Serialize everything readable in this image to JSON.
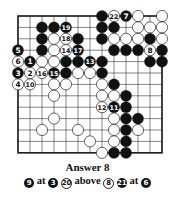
{
  "diagram": {
    "type": "go-board-partial",
    "grid": {
      "cols": 13,
      "rows": 13,
      "origin_x": 18,
      "origin_y": 16,
      "dx": 12,
      "dy": 11.4
    },
    "edges": [
      "top",
      "left",
      "right",
      "bottom"
    ],
    "colors": {
      "black": "#111111",
      "white": "#ffffff",
      "line": "#333333"
    },
    "stones": [
      {
        "c": 7,
        "r": 0,
        "color": "black"
      },
      {
        "c": 8,
        "r": 0,
        "color": "white",
        "label": "22"
      },
      {
        "c": 9,
        "r": 0,
        "color": "black",
        "label": "7"
      },
      {
        "c": 10,
        "r": 0,
        "color": "white"
      },
      {
        "c": 12,
        "r": 0,
        "color": "white"
      },
      {
        "c": 2,
        "r": 1,
        "color": "black"
      },
      {
        "c": 3,
        "r": 1,
        "color": "black"
      },
      {
        "c": 4,
        "r": 1,
        "color": "black",
        "label": "19"
      },
      {
        "c": 7,
        "r": 1,
        "color": "black"
      },
      {
        "c": 8,
        "r": 1,
        "color": "black"
      },
      {
        "c": 10,
        "r": 1,
        "color": "white"
      },
      {
        "c": 11,
        "r": 1,
        "color": "white"
      },
      {
        "c": 12,
        "r": 1,
        "color": "white"
      },
      {
        "c": 2,
        "r": 2,
        "color": "black"
      },
      {
        "c": 3,
        "r": 2,
        "color": "white"
      },
      {
        "c": 4,
        "r": 2,
        "color": "white",
        "label": "18"
      },
      {
        "c": 5,
        "r": 2,
        "color": "black"
      },
      {
        "c": 7,
        "r": 2,
        "color": "black"
      },
      {
        "c": 8,
        "r": 2,
        "color": "white"
      },
      {
        "c": 9,
        "r": 2,
        "color": "white"
      },
      {
        "c": 10,
        "r": 2,
        "color": "white"
      },
      {
        "c": 11,
        "r": 2,
        "color": "black"
      },
      {
        "c": 12,
        "r": 2,
        "color": "white"
      },
      {
        "c": 0,
        "r": 3,
        "color": "black",
        "label": "5"
      },
      {
        "c": 2,
        "r": 3,
        "color": "black"
      },
      {
        "c": 3,
        "r": 3,
        "color": "white"
      },
      {
        "c": 4,
        "r": 3,
        "color": "white",
        "label": "14"
      },
      {
        "c": 5,
        "r": 3,
        "color": "black",
        "label": "17"
      },
      {
        "c": 8,
        "r": 3,
        "color": "black"
      },
      {
        "c": 9,
        "r": 3,
        "color": "black"
      },
      {
        "c": 10,
        "r": 3,
        "color": "black"
      },
      {
        "c": 11,
        "r": 3,
        "color": "white",
        "label": "8"
      },
      {
        "c": 12,
        "r": 3,
        "color": "black"
      },
      {
        "c": 0,
        "r": 4,
        "color": "white",
        "label": "6"
      },
      {
        "c": 1,
        "r": 4,
        "color": "black",
        "label": "1"
      },
      {
        "c": 2,
        "r": 4,
        "color": "white"
      },
      {
        "c": 3,
        "r": 4,
        "color": "white"
      },
      {
        "c": 4,
        "r": 4,
        "color": "black"
      },
      {
        "c": 5,
        "r": 4,
        "color": "black"
      },
      {
        "c": 6,
        "r": 4,
        "color": "black",
        "label": "13"
      },
      {
        "c": 7,
        "r": 4,
        "color": "black"
      },
      {
        "c": 11,
        "r": 4,
        "color": "black"
      },
      {
        "c": 12,
        "r": 4,
        "color": "black"
      },
      {
        "c": 0,
        "r": 5,
        "color": "black",
        "label": "3"
      },
      {
        "c": 1,
        "r": 5,
        "color": "white",
        "label": "2"
      },
      {
        "c": 2,
        "r": 5,
        "color": "white",
        "label": "16"
      },
      {
        "c": 3,
        "r": 5,
        "color": "black",
        "label": "15"
      },
      {
        "c": 4,
        "r": 5,
        "color": "black"
      },
      {
        "c": 5,
        "r": 5,
        "color": "white"
      },
      {
        "c": 6,
        "r": 5,
        "color": "white"
      },
      {
        "c": 7,
        "r": 5,
        "color": "black"
      },
      {
        "c": 0,
        "r": 6,
        "color": "white",
        "label": "4"
      },
      {
        "c": 1,
        "r": 6,
        "color": "white",
        "label": "10"
      },
      {
        "c": 3,
        "r": 6,
        "color": "white"
      },
      {
        "c": 4,
        "r": 6,
        "color": "white"
      },
      {
        "c": 7,
        "r": 6,
        "color": "white"
      },
      {
        "c": 8,
        "r": 6,
        "color": "black"
      },
      {
        "c": 3,
        "r": 7,
        "color": "white"
      },
      {
        "c": 7,
        "r": 7,
        "color": "white"
      },
      {
        "c": 8,
        "r": 7,
        "color": "white"
      },
      {
        "c": 9,
        "r": 7,
        "color": "black"
      },
      {
        "c": 7,
        "r": 8,
        "color": "white",
        "label": "12"
      },
      {
        "c": 8,
        "r": 8,
        "color": "black",
        "label": "11"
      },
      {
        "c": 9,
        "r": 8,
        "color": "black"
      },
      {
        "c": 3,
        "r": 9,
        "color": "white"
      },
      {
        "c": 8,
        "r": 9,
        "color": "white"
      },
      {
        "c": 9,
        "r": 9,
        "color": "black"
      },
      {
        "c": 10,
        "r": 9,
        "color": "black"
      },
      {
        "c": 2,
        "r": 10,
        "color": "white"
      },
      {
        "c": 5,
        "r": 10,
        "color": "white"
      },
      {
        "c": 8,
        "r": 10,
        "color": "white"
      },
      {
        "c": 9,
        "r": 10,
        "color": "black"
      },
      {
        "c": 10,
        "r": 10,
        "color": "white"
      },
      {
        "c": 6,
        "r": 11,
        "color": "white"
      },
      {
        "c": 8,
        "r": 11,
        "color": "white"
      },
      {
        "c": 9,
        "r": 11,
        "color": "black"
      },
      {
        "c": 7,
        "r": 12,
        "color": "white"
      },
      {
        "c": 8,
        "r": 12,
        "color": "black"
      },
      {
        "c": 9,
        "r": 12,
        "color": "black"
      }
    ]
  },
  "caption": {
    "title": "Answer 8",
    "notes": [
      {
        "move": "9",
        "move_color": "black",
        "text": "at",
        "ref": "3",
        "ref_color": "black"
      },
      {
        "move": "20",
        "move_color": "white",
        "text": "above",
        "ref": "8",
        "ref_color": "white"
      },
      {
        "move": "21",
        "move_color": "black",
        "text": "at",
        "ref": "6",
        "ref_color": "black"
      }
    ]
  }
}
